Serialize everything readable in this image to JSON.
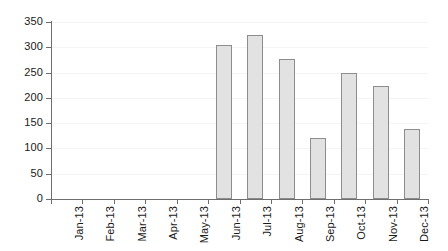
{
  "chart_data": {
    "type": "bar",
    "title": "",
    "subtitle": "",
    "xlabel": "",
    "ylabel": "",
    "categories": [
      "Jan-13",
      "Feb-13",
      "Mar-13",
      "Apr-13",
      "May-13",
      "Jun-13",
      "Jul-13",
      "Aug-13",
      "Sep-13",
      "Oct-13",
      "Nov-13",
      "Dec-13"
    ],
    "values": [
      0,
      0,
      0,
      0,
      0,
      305,
      325,
      277,
      121,
      249,
      223,
      138
    ],
    "series": [
      {
        "name": "",
        "values": [
          0,
          0,
          0,
          0,
          0,
          305,
          325,
          277,
          121,
          249,
          223,
          138
        ]
      }
    ],
    "ylim": [
      0,
      350
    ],
    "ytick_values": [
      0,
      50,
      100,
      150,
      200,
      250,
      300,
      350
    ],
    "ytick_labels": [
      "0",
      "50",
      "100",
      "150",
      "200",
      "250",
      "300",
      "350"
    ],
    "xtick_labels": [
      "Jan-13",
      "Feb-13",
      "Mar-13",
      "Apr-13",
      "May-13",
      "Jun-13",
      "Jul-13",
      "Aug-13",
      "Sep-13",
      "Oct-13",
      "Nov-13",
      "Dec-13"
    ],
    "xtick_label_rotation": 90,
    "grid": true,
    "grid_axis": "y",
    "legend": false,
    "legend_position": "none",
    "annotations": [],
    "bar_fill_color": "#e2e2e2",
    "bar_border_color": "#8d8d8d",
    "axis_color": "#6e6e6e",
    "gridline_color": "#f4f4f4",
    "text_color": "#1a1a1a",
    "background_color": "#ffffff"
  }
}
